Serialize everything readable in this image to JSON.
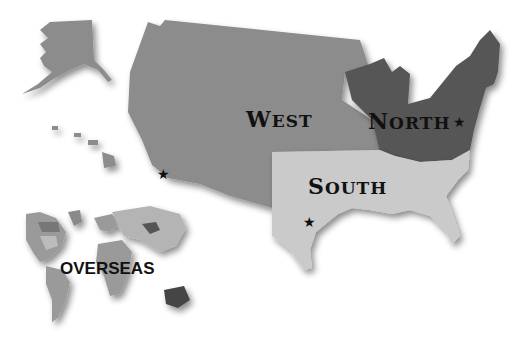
{
  "map": {
    "title": "US Regions Map",
    "regions": [
      {
        "id": "west",
        "label_first": "W",
        "label_rest": "EST",
        "color": "#8c8c8c"
      },
      {
        "id": "north",
        "label_first": "N",
        "label_rest": "ORTH",
        "color": "#575757"
      },
      {
        "id": "south",
        "label_first": "S",
        "label_rest": "OUTH",
        "color": "#cacaca"
      },
      {
        "id": "overseas",
        "label": "OVERSEAS",
        "color": "#9a9a9a"
      }
    ],
    "markers": [
      {
        "id": "west-office",
        "glyph": "★"
      },
      {
        "id": "north-office",
        "glyph": "★"
      },
      {
        "id": "south-office",
        "glyph": "★"
      }
    ]
  }
}
